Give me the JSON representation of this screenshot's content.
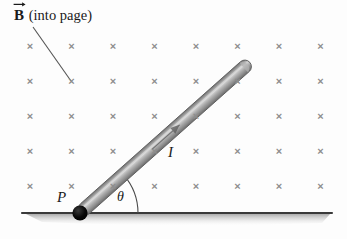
{
  "figure": {
    "width": 347,
    "height": 239,
    "background_color": "#fdfdfd"
  },
  "labels": {
    "field_symbol": "B",
    "field_note": "(into page)",
    "field_full": "B (into page)",
    "current": "I",
    "pivot": "P",
    "angle": "θ"
  },
  "colors": {
    "field_mark": "#8d8d8d",
    "rod_light": "#cfcfcf",
    "rod_mid": "#9a9a9a",
    "rod_dark": "#6f6f6f",
    "ground_line": "#3a3a3a",
    "ground_shadow": "#b8b8b8",
    "pivot": "#000000",
    "leader_line": "#555555",
    "text": "#1a1a1a"
  },
  "field_grid": {
    "symbol": "×",
    "columns": 8,
    "rows": 5,
    "x_start": 30,
    "x_step": 41.5,
    "y_start": 46,
    "y_step": 35,
    "count": 40,
    "description": "Array of x marks indicating magnetic field directed into the page"
  },
  "rod": {
    "pivot_point": [
      80,
      213
    ],
    "tip_point": [
      250,
      62
    ],
    "angle_degrees": 41,
    "thickness": 13,
    "current_arrow_direction": "from pivot toward tip"
  },
  "ground": {
    "x_start": 22,
    "x_end": 332,
    "y": 213
  },
  "angle_arc": {
    "center": [
      80,
      213
    ],
    "radius": 58,
    "from_degrees": 0,
    "to_degrees": 41
  },
  "leader_line": {
    "from": [
      33,
      27
    ],
    "to": [
      71,
      81
    ]
  }
}
